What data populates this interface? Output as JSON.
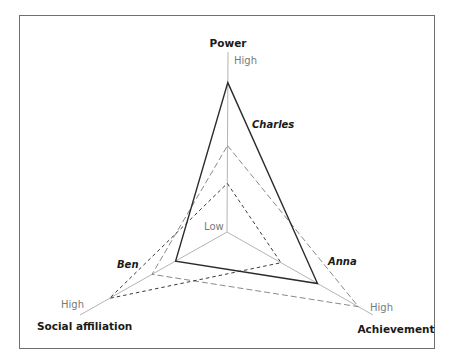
{
  "chart_data": {
    "type": "radar",
    "title": "",
    "axes": [
      "Power",
      "Achievement",
      "Social affiliation"
    ],
    "scale_labels": {
      "low": "Low",
      "high": "High"
    },
    "range": [
      0,
      1
    ],
    "grid": false,
    "series": [
      {
        "name": "Charles",
        "style": "solid",
        "color": "#2b2b2b",
        "values": {
          "Power": 0.83,
          "Achievement": 0.62,
          "Social affiliation": 0.35
        }
      },
      {
        "name": "Anna",
        "style": "long-dash",
        "color": "#8a8a8a",
        "values": {
          "Power": 0.48,
          "Achievement": 0.9,
          "Social affiliation": 0.51
        }
      },
      {
        "name": "Ben",
        "style": "short-dash",
        "color": "#3a3a3a",
        "values": {
          "Power": 0.27,
          "Achievement": 0.37,
          "Social affiliation": 0.8
        }
      }
    ]
  },
  "labels": {
    "power": "Power",
    "achievement": "Achievement",
    "social": "Social affiliation",
    "high_top": "High",
    "high_right": "High",
    "high_left": "High",
    "low": "Low",
    "charles": "Charles",
    "anna": "Anna",
    "ben": "Ben"
  }
}
